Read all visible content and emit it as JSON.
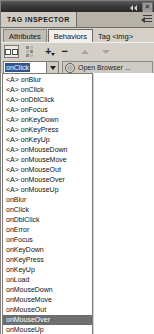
{
  "window": {
    "title_bar": {
      "collapse_icon": "collapse-arrows-icon",
      "close_label": "✕"
    },
    "panel_title": "TAG INSPECTOR",
    "panel_menu_icon": "panel-options-menu-icon"
  },
  "tabs": [
    {
      "label": "Attributes",
      "active": false,
      "style": "tab"
    },
    {
      "label": "Behaviors",
      "active": true,
      "style": "tab"
    },
    {
      "label": "Tag <img>",
      "active": false,
      "style": "plain"
    }
  ],
  "toolbar": {
    "buttons": [
      {
        "name": "show-set-events-button",
        "icon": "two-column-list-icon",
        "pressed": true
      },
      {
        "name": "show-all-events-button",
        "icon": "tree-list-icon",
        "pressed": false
      },
      {
        "name": "add-behavior-button",
        "icon": "plus-icon",
        "label": "+"
      },
      {
        "name": "remove-behavior-button",
        "icon": "minus-icon",
        "label": "−"
      },
      {
        "name": "move-event-up-button",
        "icon": "arrow-up-icon",
        "disabled": true
      },
      {
        "name": "move-event-down-button",
        "icon": "arrow-down-icon",
        "disabled": true
      }
    ]
  },
  "event_row": {
    "combo_value": "onClick",
    "combo_selected": true,
    "dropdown_arrow_icon": "chevron-down-icon",
    "action_icon": "gear-icon",
    "action_label": "Open Browser ..."
  },
  "dropdown": {
    "selected": "onMouseOver",
    "options": [
      {
        "prefix": "<A> ",
        "name": "onBlur"
      },
      {
        "prefix": "<A> ",
        "name": "onClick"
      },
      {
        "prefix": "<A> ",
        "name": "onDblClick"
      },
      {
        "prefix": "<A> ",
        "name": "onFocus"
      },
      {
        "prefix": "<A> ",
        "name": "onKeyDown"
      },
      {
        "prefix": "<A> ",
        "name": "onKeyPress"
      },
      {
        "prefix": "<A> ",
        "name": "onKeyUp"
      },
      {
        "prefix": "<A> ",
        "name": "onMouseDown"
      },
      {
        "prefix": "<A> ",
        "name": "onMouseMove"
      },
      {
        "prefix": "<A> ",
        "name": "onMouseOut"
      },
      {
        "prefix": "<A> ",
        "name": "onMouseOver"
      },
      {
        "prefix": "<A> ",
        "name": "onMouseUp"
      },
      {
        "prefix": "",
        "name": "onBlur"
      },
      {
        "prefix": "",
        "name": "onClick"
      },
      {
        "prefix": "",
        "name": "onDblClick"
      },
      {
        "prefix": "",
        "name": "onError"
      },
      {
        "prefix": "",
        "name": "onFocus"
      },
      {
        "prefix": "",
        "name": "onKeyDown"
      },
      {
        "prefix": "",
        "name": "onKeyPress"
      },
      {
        "prefix": "",
        "name": "onKeyUp"
      },
      {
        "prefix": "",
        "name": "onLoad"
      },
      {
        "prefix": "",
        "name": "onMouseDown"
      },
      {
        "prefix": "",
        "name": "onMouseMove"
      },
      {
        "prefix": "",
        "name": "onMouseOut"
      },
      {
        "prefix": "",
        "name": "onMouseOver"
      },
      {
        "prefix": "",
        "name": "onMouseUp"
      }
    ]
  },
  "colors": {
    "panel_face": "#d4d0c8",
    "titlebar": "#3a3a3a",
    "selection_blue": "#31538f",
    "list_selection_gray": "#6e6e6e",
    "list_bg": "#ffffff"
  }
}
